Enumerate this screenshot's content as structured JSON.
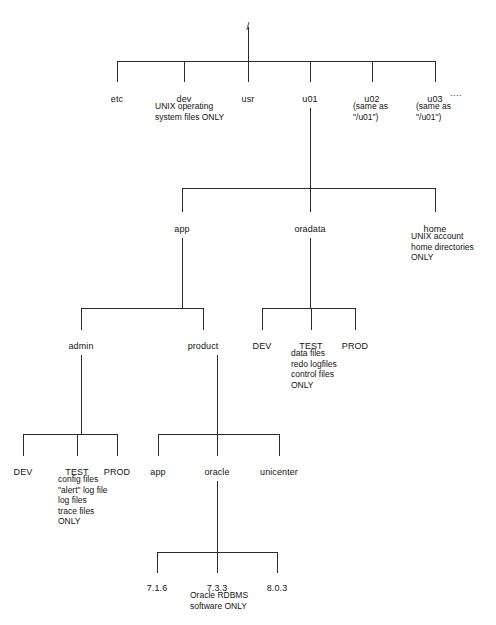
{
  "diagram": {
    "type": "tree-diagram",
    "line_color": "#2b2b2b",
    "background_color": "#ffffff",
    "text_color": "#141414"
  },
  "nodes": [
    {
      "id": "root",
      "label": "/",
      "x": 248,
      "y": 22,
      "level": 0
    },
    {
      "id": "etc",
      "label": "etc",
      "x": 117,
      "y": 94,
      "level": 1
    },
    {
      "id": "dev",
      "label": "dev",
      "x": 184,
      "y": 94,
      "level": 1
    },
    {
      "id": "usr",
      "label": "usr",
      "x": 248,
      "y": 94,
      "level": 1
    },
    {
      "id": "u01",
      "label": "u01",
      "x": 310,
      "y": 94,
      "level": 1
    },
    {
      "id": "u02",
      "label": "u02",
      "x": 372,
      "y": 94,
      "level": 1
    },
    {
      "id": "u03",
      "label": "u03",
      "x": 435,
      "y": 94,
      "level": 1
    },
    {
      "id": "app",
      "label": "app",
      "x": 182,
      "y": 224,
      "level": 2
    },
    {
      "id": "oradata",
      "label": "oradata",
      "x": 310,
      "y": 224,
      "level": 2
    },
    {
      "id": "home",
      "label": "home",
      "x": 435,
      "y": 224,
      "level": 2
    },
    {
      "id": "admin",
      "label": "admin",
      "x": 81,
      "y": 341,
      "level": 3
    },
    {
      "id": "product",
      "label": "product",
      "x": 203,
      "y": 341,
      "level": 3
    },
    {
      "id": "ora_dev",
      "label": "DEV",
      "x": 262,
      "y": 341,
      "level": 3
    },
    {
      "id": "ora_test",
      "label": "TEST",
      "x": 311,
      "y": 341,
      "level": 3
    },
    {
      "id": "ora_prod",
      "label": "PROD",
      "x": 355,
      "y": 341,
      "level": 3
    },
    {
      "id": "adm_dev",
      "label": "DEV",
      "x": 23,
      "y": 467,
      "level": 4
    },
    {
      "id": "adm_test",
      "label": "TEST",
      "x": 77,
      "y": 467,
      "level": 4
    },
    {
      "id": "adm_prod",
      "label": "PROD",
      "x": 117,
      "y": 467,
      "level": 4
    },
    {
      "id": "prod_app",
      "label": "app",
      "x": 158,
      "y": 467,
      "level": 4
    },
    {
      "id": "oracle",
      "label": "oracle",
      "x": 217,
      "y": 467,
      "level": 4
    },
    {
      "id": "unicenter",
      "label": "unicenter",
      "x": 279,
      "y": 467,
      "level": 4
    },
    {
      "id": "v716",
      "label": "7.1.6",
      "x": 157,
      "y": 583,
      "level": 5
    },
    {
      "id": "v733",
      "label": "7.3.3",
      "x": 217,
      "y": 583,
      "level": 5
    },
    {
      "id": "v803",
      "label": "8.0.3",
      "x": 277,
      "y": 583,
      "level": 5
    }
  ],
  "connectors": [
    {
      "id": "root-stem",
      "x1": 248,
      "y1": 27,
      "x2": 248,
      "y2": 61
    },
    {
      "id": "level1-bar",
      "x1": 117,
      "y1": 61,
      "x2": 435,
      "y2": 61
    },
    {
      "id": "etc-stem",
      "x1": 117,
      "y1": 61,
      "x2": 117,
      "y2": 82
    },
    {
      "id": "dev-stem",
      "x1": 184,
      "y1": 61,
      "x2": 184,
      "y2": 82
    },
    {
      "id": "usr-stem",
      "x1": 248,
      "y1": 61,
      "x2": 248,
      "y2": 82
    },
    {
      "id": "u01-stem",
      "x1": 310,
      "y1": 61,
      "x2": 310,
      "y2": 82
    },
    {
      "id": "u02-stem",
      "x1": 372,
      "y1": 61,
      "x2": 372,
      "y2": 82
    },
    {
      "id": "u03-stem",
      "x1": 435,
      "y1": 61,
      "x2": 435,
      "y2": 82
    },
    {
      "id": "u01-down",
      "x1": 310,
      "y1": 108,
      "x2": 310,
      "y2": 188
    },
    {
      "id": "level2-bar",
      "x1": 182,
      "y1": 188,
      "x2": 435,
      "y2": 188
    },
    {
      "id": "app-stem",
      "x1": 182,
      "y1": 188,
      "x2": 182,
      "y2": 212
    },
    {
      "id": "oradata-stem",
      "x1": 310,
      "y1": 188,
      "x2": 310,
      "y2": 212
    },
    {
      "id": "home-stem",
      "x1": 435,
      "y1": 188,
      "x2": 435,
      "y2": 212
    },
    {
      "id": "app-down",
      "x1": 182,
      "y1": 238,
      "x2": 182,
      "y2": 308
    },
    {
      "id": "level3-app-bar",
      "x1": 81,
      "y1": 308,
      "x2": 203,
      "y2": 308
    },
    {
      "id": "admin-stem",
      "x1": 81,
      "y1": 308,
      "x2": 81,
      "y2": 330
    },
    {
      "id": "product-stem",
      "x1": 203,
      "y1": 308,
      "x2": 203,
      "y2": 330
    },
    {
      "id": "oradata-down",
      "x1": 310,
      "y1": 238,
      "x2": 310,
      "y2": 308
    },
    {
      "id": "level3-ora-bar",
      "x1": 262,
      "y1": 308,
      "x2": 355,
      "y2": 308
    },
    {
      "id": "oradev-stem",
      "x1": 262,
      "y1": 308,
      "x2": 262,
      "y2": 330
    },
    {
      "id": "oratest-stem",
      "x1": 311,
      "y1": 308,
      "x2": 311,
      "y2": 330
    },
    {
      "id": "oraprod-stem",
      "x1": 355,
      "y1": 308,
      "x2": 355,
      "y2": 330
    },
    {
      "id": "admin-down",
      "x1": 81,
      "y1": 355,
      "x2": 81,
      "y2": 434
    },
    {
      "id": "level4-admin-bar",
      "x1": 23,
      "y1": 434,
      "x2": 117,
      "y2": 434
    },
    {
      "id": "admdev-stem",
      "x1": 23,
      "y1": 434,
      "x2": 23,
      "y2": 456
    },
    {
      "id": "admtest-stem",
      "x1": 77,
      "y1": 434,
      "x2": 77,
      "y2": 456
    },
    {
      "id": "admprod-stem",
      "x1": 117,
      "y1": 434,
      "x2": 117,
      "y2": 456
    },
    {
      "id": "product-down",
      "x1": 217,
      "y1": 355,
      "x2": 217,
      "y2": 434
    },
    {
      "id": "level4-prod-bar",
      "x1": 158,
      "y1": 434,
      "x2": 279,
      "y2": 434
    },
    {
      "id": "prodapp-stem",
      "x1": 158,
      "y1": 434,
      "x2": 158,
      "y2": 456
    },
    {
      "id": "oracle-stem",
      "x1": 217,
      "y1": 434,
      "x2": 217,
      "y2": 456
    },
    {
      "id": "unicenter-stem",
      "x1": 279,
      "y1": 434,
      "x2": 279,
      "y2": 456
    },
    {
      "id": "oracle-down",
      "x1": 217,
      "y1": 481,
      "x2": 217,
      "y2": 552
    },
    {
      "id": "level5-bar",
      "x1": 157,
      "y1": 552,
      "x2": 277,
      "y2": 552
    },
    {
      "id": "v716-stem",
      "x1": 157,
      "y1": 552,
      "x2": 157,
      "y2": 573
    },
    {
      "id": "v733-stem",
      "x1": 217,
      "y1": 552,
      "x2": 217,
      "y2": 573
    },
    {
      "id": "v803-stem",
      "x1": 277,
      "y1": 552,
      "x2": 277,
      "y2": 573
    }
  ],
  "annotations": [
    {
      "id": "dev-note",
      "text": "UNIX operating\nsystem files ONLY",
      "x": 155,
      "y": 101
    },
    {
      "id": "u02-note",
      "text": "(same as\n\"/u01\")",
      "x": 353,
      "y": 101
    },
    {
      "id": "u03-note",
      "text": "(same as\n\"/u01\")",
      "x": 416,
      "y": 101
    },
    {
      "id": "home-note",
      "text": "UNIX account\nhome directories\nONLY",
      "x": 411,
      "y": 231
    },
    {
      "id": "oradata-note",
      "text": "data files\nredo logfiles\ncontrol files\nONLY",
      "x": 291,
      "y": 348
    },
    {
      "id": "admin-note",
      "text": "config files\n\"alert\" log file\nlog files\ntrace files\nONLY",
      "x": 58,
      "y": 474
    },
    {
      "id": "oracle-note",
      "text": "Oracle RDBMS\nsoftware ONLY",
      "x": 190,
      "y": 590
    }
  ],
  "ellipsis": {
    "id": "u03-ellipsis",
    "text": "....",
    "x": 450,
    "y": 88
  }
}
